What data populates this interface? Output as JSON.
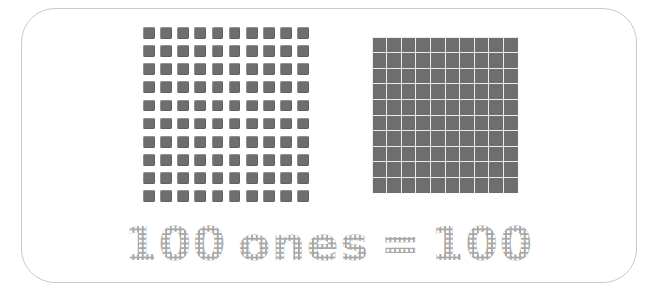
{
  "page": {
    "kind": "place-value-poster",
    "background_color": "#ffffff"
  },
  "card": {
    "border_color": "#c9c9c9",
    "fill_color": "#ffffff",
    "corner_radius_px": 34
  },
  "ones_grid": {
    "label": "100 ones as individual unit cubes",
    "rows": 10,
    "columns": 10,
    "total": 100,
    "unit_color": "#6e6e6e"
  },
  "hundred_flat": {
    "label": "hundred flat block",
    "rows": 10,
    "columns": 10,
    "total": 100,
    "fill_color": "#6e6e6e",
    "gridline_color": "#ebebeb"
  },
  "caption": {
    "left_number": "100",
    "word": "ones",
    "equals": "=",
    "right_number": "100",
    "full_text": "100 ones = 100",
    "text_color": "#a8a8a8",
    "dot_color": "#ffffff"
  }
}
